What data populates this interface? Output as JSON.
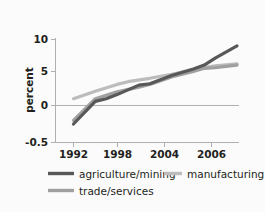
{
  "chart_data": {
    "type": "line",
    "title": "",
    "xlabel": "",
    "ylabel": "percent",
    "xlim": [
      1992,
      2007
    ],
    "ylim": [
      -0.5,
      10
    ],
    "grid": false,
    "zero_line": true,
    "legend_position": "below",
    "x_ticks": [
      "1992",
      "1998",
      "2004",
      "2006"
    ],
    "x_tick_values": [
      1992,
      1998,
      2004,
      2006
    ],
    "y_ticks": [
      "10",
      "5",
      "0",
      "-0.5"
    ],
    "y_tick_values": [
      10,
      5,
      0,
      -0.5
    ],
    "series": [
      {
        "name": "agriculture/mining",
        "color": "#585858",
        "x": [
          1992,
          1994,
          1995,
          1996,
          1998,
          1999,
          2001,
          2003,
          2004,
          2005,
          2007
        ],
        "values": [
          -0.25,
          0.6,
          1.0,
          1.6,
          3.0,
          3.2,
          4.4,
          5.4,
          6.0,
          7.1,
          9.0
        ]
      },
      {
        "name": "manufacturing",
        "color": "#bcbcbc",
        "x": [
          1992,
          1994,
          1996,
          1997,
          1999,
          2001,
          2003,
          2004,
          2005,
          2007
        ],
        "values": [
          1.0,
          2.1,
          3.1,
          3.5,
          4.0,
          4.6,
          5.3,
          5.6,
          5.9,
          6.2
        ]
      },
      {
        "name": "trade/services",
        "color": "#a0a0a0",
        "x": [
          1992,
          1994,
          1996,
          1998,
          1999,
          2001,
          2003,
          2004,
          2005,
          2007
        ],
        "values": [
          -0.2,
          1.0,
          2.0,
          2.7,
          3.1,
          4.2,
          5.0,
          5.5,
          5.6,
          6.0
        ]
      }
    ]
  },
  "axis": {
    "y_title": "percent",
    "y_tick_0": "10",
    "y_tick_1": "5",
    "y_tick_2": "0",
    "y_tick_3": "-0.5",
    "x_tick_0": "1992",
    "x_tick_1": "1998",
    "x_tick_2": "2004",
    "x_tick_3": "2006"
  },
  "legend": {
    "items": [
      {
        "label": "agriculture/mining",
        "color": "#585858"
      },
      {
        "label": "manufacturing",
        "color": "#bcbcbc"
      },
      {
        "label": "trade/services",
        "color": "#a0a0a0"
      }
    ]
  },
  "colors": {
    "background": "#fbfbfb",
    "axis": "#b0b0b0",
    "zero_line": "#b0b0b0",
    "text": "#231f20"
  }
}
